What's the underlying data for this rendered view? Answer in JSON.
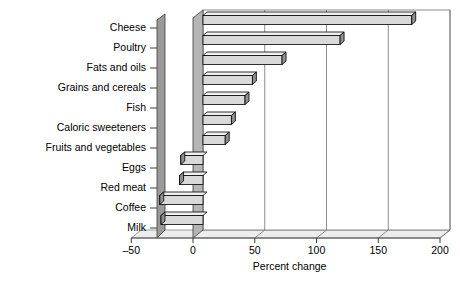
{
  "chart_data": {
    "type": "bar",
    "orientation": "horizontal",
    "title": "",
    "subtitle": "",
    "xlabel": "Percent change",
    "ylabel": "",
    "xlim": [
      -50,
      200
    ],
    "xticks": [
      -50,
      0,
      50,
      100,
      150,
      200
    ],
    "xtick_labels": [
      "–50",
      "0",
      "50",
      "100",
      "150",
      "200"
    ],
    "grid": true,
    "grid_axis": "x",
    "legend": null,
    "style": "3d-perspective",
    "bar_fill_color": "#d9d9d9",
    "bar_edge_color": "#000000",
    "background_color": "#ffffff",
    "categories": [
      "Cheese",
      "Poultry",
      "Fats and oils",
      "Grains and cereals",
      "Fish",
      "Caloric sweeteners",
      "Fruits and vegetables",
      "Eggs",
      "Red meat",
      "Coffee",
      "Milk"
    ],
    "values": [
      169,
      111,
      64,
      40,
      34,
      23,
      18,
      -18,
      -19,
      -35,
      -34
    ],
    "series": [
      {
        "name": "Percent change",
        "values": [
          169,
          111,
          64,
          40,
          34,
          23,
          18,
          -18,
          -19,
          -35,
          -34
        ]
      }
    ]
  }
}
